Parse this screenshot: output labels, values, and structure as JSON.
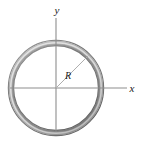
{
  "figure": {
    "background_color": "#ffffff",
    "width": 144,
    "height": 144
  },
  "labels": {
    "y_axis": "y",
    "x_axis": "x",
    "radius": "R"
  },
  "geometry": {
    "center_x": 56,
    "center_y": 88,
    "outer_radius": 48,
    "inner_radius": 42,
    "tube_thickness": 6,
    "radius_line_angle_deg": 45,
    "y_axis_top": 18,
    "y_axis_bottom": 132,
    "x_axis_left": 10,
    "x_axis_right": 127
  },
  "colors": {
    "ring_outer_edge": "#6e6e6e",
    "ring_mid_dark": "#8c8c8c",
    "ring_highlight": "#d8d8d8",
    "ring_shadow": "#5a5a5a",
    "axis_line": "#8a8a8a",
    "radius_line": "#a0a0a0",
    "text": "#1a1a1a",
    "background": "#ffffff"
  }
}
